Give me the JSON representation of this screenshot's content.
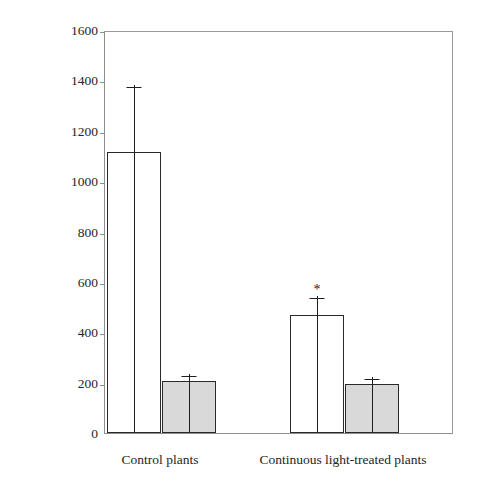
{
  "chart_data": {
    "type": "bar",
    "title": "",
    "xlabel": "",
    "ylabel_line1": "Leaf stomatal conductance (mmol m",
    "ylabel_line1_sup1": "-2",
    "ylabel_line1_mid": " s",
    "ylabel_line1_sup2": "-1",
    "ylabel_line1_end": ")",
    "ylabel_line2_a": "or leaf intercellular CO",
    "ylabel_line2_sub": "2",
    "ylabel_line2_b": " concentration (ppm)",
    "categories": [
      "Control plants",
      "Continuous light-treated plants"
    ],
    "ylim": [
      0,
      1600
    ],
    "yticks": [
      0,
      200,
      400,
      600,
      800,
      1000,
      1200,
      1400,
      1600
    ],
    "ytick_labels": [
      "0",
      "200",
      "400",
      "600",
      "800",
      "1000",
      "1200",
      "1400",
      "1600"
    ],
    "grid": false,
    "legend": "none",
    "series": [
      {
        "name": "Leaf stomatal conductance",
        "fill": "#ffffff",
        "values": [
          1115,
          470
        ],
        "errors": [
          268,
          72
        ],
        "annotations": [
          "",
          "*"
        ]
      },
      {
        "name": "Leaf intercellular CO2 concentration",
        "fill": "#d9d9d9",
        "values": [
          205,
          194
        ],
        "errors": [
          29,
          28
        ],
        "annotations": [
          "",
          ""
        ]
      }
    ],
    "significance_marker": "*",
    "colors": {
      "bar_white": "#ffffff",
      "bar_grey": "#d9d9d9",
      "bar_outline": "#2a2a2a",
      "axis": "#8d8d8d",
      "text": "#242424",
      "background": "#ffffff"
    }
  }
}
